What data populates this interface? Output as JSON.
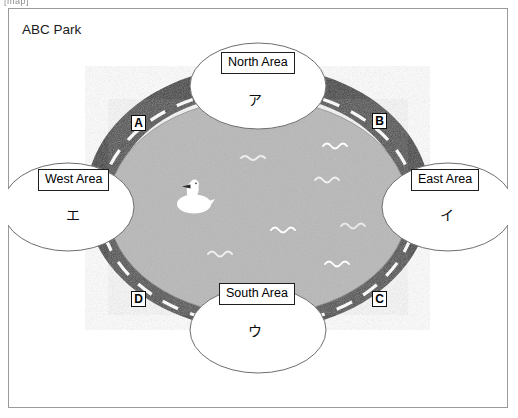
{
  "artifact_text": "[map]",
  "park": {
    "title": "ABC Park"
  },
  "colors": {
    "road": "#3d3d3d",
    "road_dash": "#ffffff",
    "water": "#b8b8b8",
    "area_fill": "#ffffff",
    "outline": "#6e6e6e",
    "frame": "#9a9a9a",
    "label_border": "#1d1d1d",
    "text": "#000000"
  },
  "areas": [
    {
      "id": "north",
      "label": "North Area",
      "kana": "ア"
    },
    {
      "id": "east",
      "label": "East Area",
      "kana": "イ"
    },
    {
      "id": "south",
      "label": "South Area",
      "kana": "ウ"
    },
    {
      "id": "west",
      "label": "West Area",
      "kana": "エ"
    }
  ],
  "road_markers": [
    {
      "id": "a",
      "label": "A",
      "position": "north-west"
    },
    {
      "id": "b",
      "label": "B",
      "position": "north-east"
    },
    {
      "id": "c",
      "label": "C",
      "position": "south-east"
    },
    {
      "id": "d",
      "label": "D",
      "position": "south-west"
    }
  ],
  "icons": {
    "swan": "swan-icon",
    "waves": "water-wave-icon"
  },
  "waves": [
    {
      "x": 238,
      "y": 150
    },
    {
      "x": 320,
      "y": 138
    },
    {
      "x": 312,
      "y": 172
    },
    {
      "x": 268,
      "y": 222
    },
    {
      "x": 338,
      "y": 218
    },
    {
      "x": 205,
      "y": 246
    },
    {
      "x": 322,
      "y": 256
    }
  ]
}
